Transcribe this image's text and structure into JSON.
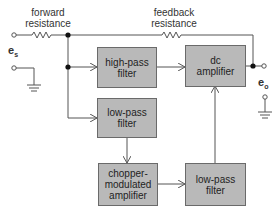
{
  "diagram": {
    "labels": {
      "forward_resistance": "forward\nresistance",
      "feedback_resistance": "feedback\nresistance",
      "input_voltage": "e",
      "input_voltage_sub": "s",
      "output_voltage": "e",
      "output_voltage_sub": "o"
    },
    "blocks": [
      {
        "id": "high-pass-filter",
        "label": "high-pass\nfilter"
      },
      {
        "id": "dc-amplifier",
        "label": "dc\namplifier"
      },
      {
        "id": "low-pass-filter-input",
        "label": "low-pass\nfilter"
      },
      {
        "id": "chopper-modulated-amplifier",
        "label": "chopper-\nmodulated\namplifier"
      },
      {
        "id": "low-pass-filter-output",
        "label": "low-pass\nfilter"
      }
    ],
    "connections": [
      {
        "from": "input",
        "to": "high-pass-filter"
      },
      {
        "from": "input",
        "to": "low-pass-filter-input"
      },
      {
        "from": "high-pass-filter",
        "to": "dc-amplifier"
      },
      {
        "from": "low-pass-filter-input",
        "to": "chopper-modulated-amplifier"
      },
      {
        "from": "chopper-modulated-amplifier",
        "to": "low-pass-filter-output"
      },
      {
        "from": "low-pass-filter-output",
        "to": "dc-amplifier"
      },
      {
        "from": "dc-amplifier",
        "to": "output"
      },
      {
        "from": "output",
        "to": "input-junction",
        "via": "feedback resistance"
      }
    ],
    "colors": {
      "block_fill": "#b9b9b9",
      "line": "#555555"
    }
  }
}
